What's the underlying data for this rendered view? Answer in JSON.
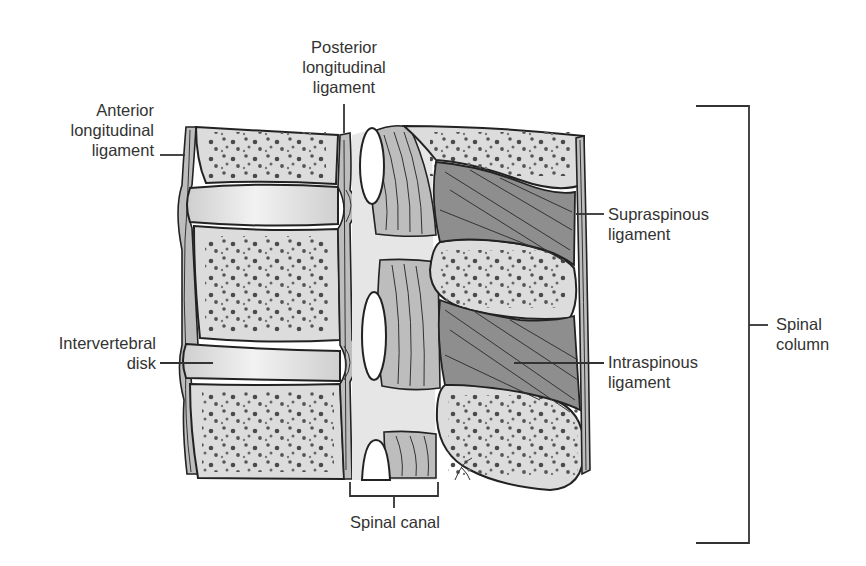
{
  "diagram": {
    "labels": {
      "anterior_longitudinal_ligament": "Anterior\nlongitudinal\nligament",
      "posterior_longitudinal_ligament": "Posterior\nlongitudinal\nligament",
      "supraspinous_ligament": "Supraspinous\nligament",
      "intervertebral_disk": "Intervertebral\ndisk",
      "intraspinous_ligament": "Intraspinous\nligament",
      "spinal_column": "Spinal\ncolumn",
      "spinal_canal": "Spinal canal"
    },
    "structures": [
      "vertebral-body-upper",
      "vertebral-body-middle",
      "vertebral-body-lower",
      "intervertebral-disk-upper",
      "intervertebral-disk-lower",
      "spinous-process-upper",
      "spinous-process-middle",
      "spinous-process-lower",
      "spinal-canal",
      "intervertebral-foramina"
    ],
    "colors": {
      "bone": "#dcdcdc",
      "ligament": "#bdbdbd",
      "intraspinous": "#8e8e8e",
      "outline": "#222222",
      "text": "#333333"
    }
  }
}
